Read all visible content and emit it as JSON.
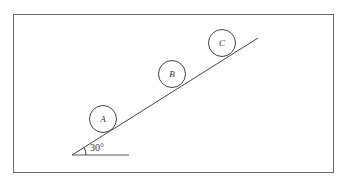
{
  "diagram": {
    "type": "inclined-plane",
    "angle_label": "30°",
    "balls": [
      {
        "label": "A"
      },
      {
        "label": "B"
      },
      {
        "label": "C"
      }
    ],
    "colors": {
      "stroke": "#444444",
      "frame": "#666666",
      "background": "#ffffff"
    }
  }
}
